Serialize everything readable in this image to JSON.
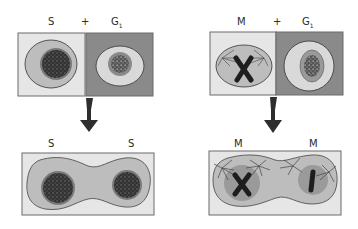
{
  "panels": [
    {
      "name": "s-g1-fusion",
      "top_labels": {
        "left": "S",
        "plus": "+",
        "right_main": "G",
        "right_sub": "1"
      },
      "bottom_labels": {
        "left": "S",
        "right": "S"
      }
    },
    {
      "name": "m-g1-fusion",
      "top_labels": {
        "left": "M",
        "plus": "+",
        "right_main": "G",
        "right_sub": "1"
      },
      "bottom_labels": {
        "left": "M",
        "right": "M"
      }
    }
  ],
  "colors": {
    "light_bg": "#e6e6e6",
    "dark_bg": "#8a8a8a",
    "cell": "#bdbdbd",
    "cell_light": "#d9d9d9",
    "nucleus_dark": "#303030",
    "nucleus_mid": "#888888",
    "chromosome": "#1e1e1e",
    "arrow": "#2e2e2e",
    "border": "#6a6a6a"
  }
}
